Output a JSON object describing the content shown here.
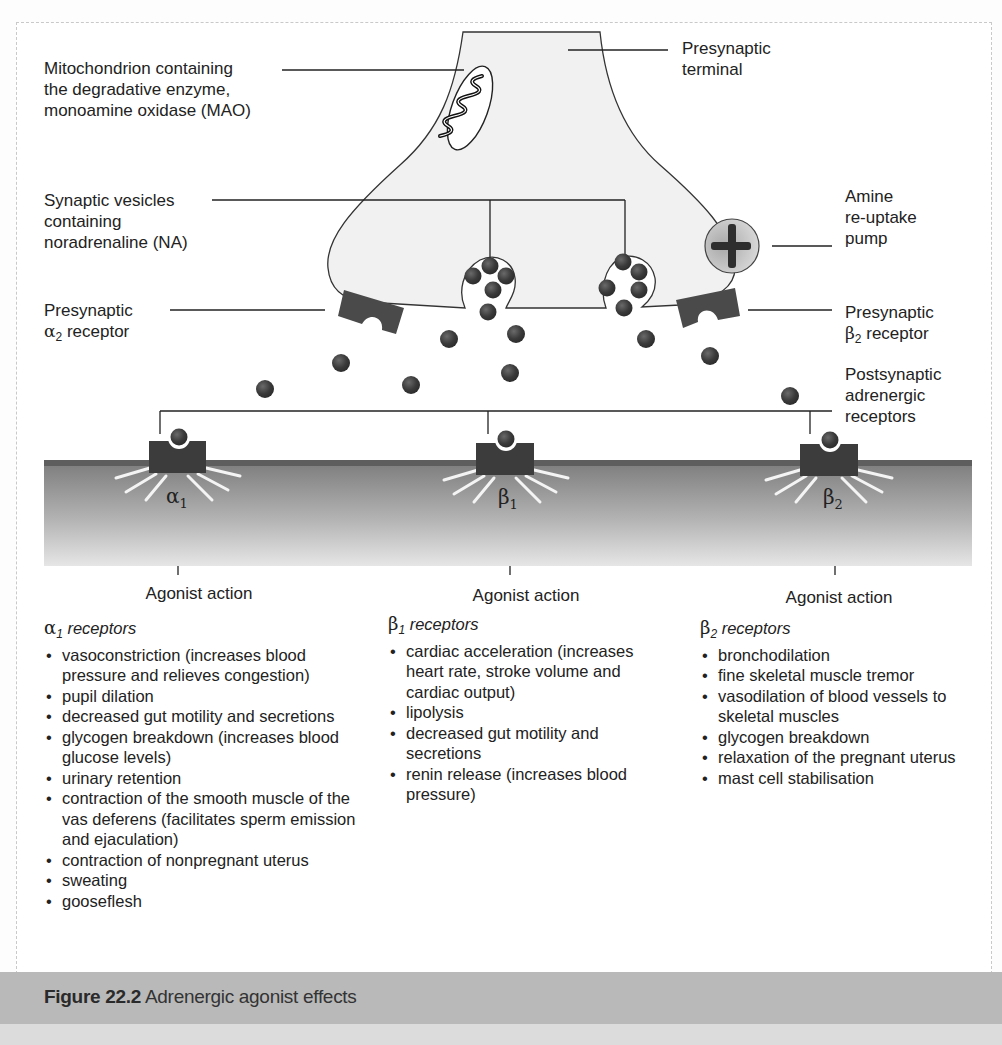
{
  "labels": {
    "mitochondrion": [
      "Mitochondrion containing",
      "the degradative enzyme,",
      "monoamine oxidase (MAO)"
    ],
    "presynaptic_terminal": [
      "Presynaptic",
      "terminal"
    ],
    "synaptic_vesicles": [
      "Synaptic vesicles",
      "containing",
      "noradrenaline (NA)"
    ],
    "reuptake_pump": [
      "Amine",
      "re-uptake",
      "pump"
    ],
    "presynaptic_alpha2": {
      "line1": "Presynaptic",
      "greek": "α",
      "sub": "2",
      "rest": " receptor"
    },
    "presynaptic_beta2": {
      "line1": "Presynaptic",
      "greek": "β",
      "sub": "2",
      "rest": " receptor"
    },
    "postsynaptic": [
      "Postsynaptic",
      "adrenergic",
      "receptors"
    ]
  },
  "receptors": [
    {
      "greek": "α",
      "sub": "1",
      "agonist_label": "Agonist action"
    },
    {
      "greek": "β",
      "sub": "1",
      "agonist_label": "Agonist action"
    },
    {
      "greek": "β",
      "sub": "2",
      "agonist_label": "Agonist action"
    }
  ],
  "columns": [
    {
      "greek": "α",
      "sub": "1",
      "heading": "receptors",
      "items": [
        "vasoconstriction (increases blood pressure and relieves congestion)",
        "pupil dilation",
        "decreased gut motility and secretions",
        "glycogen breakdown (increases blood glucose levels)",
        "urinary retention",
        "contraction of the smooth muscle of the vas deferens (facilitates sperm emission and ejaculation)",
        "contraction of nonpregnant uterus",
        "sweating",
        "gooseflesh"
      ]
    },
    {
      "greek": "β",
      "sub": "1",
      "heading": "receptors",
      "items": [
        "cardiac acceleration (increases heart rate, stroke volume and cardiac output)",
        "lipolysis",
        "decreased gut motility and secretions",
        "renin release (increases blood pressure)"
      ]
    },
    {
      "greek": "β",
      "sub": "2",
      "heading": "receptors",
      "items": [
        "bronchodilation",
        "fine skeletal muscle tremor",
        "vasodilation of blood vessels to skeletal muscles",
        "glycogen breakdown",
        "relaxation of the pregnant uterus",
        "mast cell stabilisation"
      ]
    }
  ],
  "caption": {
    "figure_number": "Figure 22.2",
    "title": "Adrenergic agonist effects"
  },
  "colors": {
    "terminal_fill": "#f1f1f1",
    "receptor_dark": "#3e3e3e",
    "neurotransmitter": "#3a3a3a",
    "membrane_top": "#6f6f6f",
    "caption_bar": "#b9b9b9"
  }
}
